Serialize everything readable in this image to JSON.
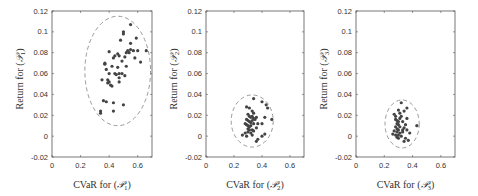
{
  "chart_data": [
    {
      "type": "scatter",
      "title": "",
      "xlabel": "CVaR for (P1)",
      "ylabel": "Return for (P1)",
      "xlabel_parts": {
        "pre": "CVaR for (",
        "sym": "𝒫",
        "sub": "1",
        "post": ")"
      },
      "ylabel_parts": {
        "pre": "Return for (",
        "sym": "𝒫",
        "sub": "1",
        "post": ")"
      },
      "xlim": [
        0,
        0.7
      ],
      "ylim": [
        -0.02,
        0.12
      ],
      "xticks": [
        0,
        0.2,
        0.4,
        0.6
      ],
      "xtick_labels": [
        "0",
        "0.2",
        "0.4",
        "0.6"
      ],
      "yticks": [
        -0.02,
        0,
        0.02,
        0.04,
        0.06,
        0.08,
        0.1,
        0.12
      ],
      "ytick_labels": [
        "-0.02",
        "0",
        "0.02",
        "0.04",
        "0.06",
        "0.08",
        "0.1",
        "0.12"
      ],
      "grid": false,
      "ellipse": {
        "cx": 0.46,
        "cy": 0.0625,
        "rx": 0.23,
        "ry": 0.0525,
        "style": "dashed"
      },
      "points": [
        [
          0.55,
          0.107
        ],
        [
          0.5,
          0.1
        ],
        [
          0.5,
          0.098
        ],
        [
          0.59,
          0.094
        ],
        [
          0.48,
          0.092
        ],
        [
          0.55,
          0.089
        ],
        [
          0.4,
          0.081
        ],
        [
          0.53,
          0.082
        ],
        [
          0.55,
          0.083
        ],
        [
          0.57,
          0.082
        ],
        [
          0.6,
          0.082
        ],
        [
          0.66,
          0.082
        ],
        [
          0.52,
          0.08
        ],
        [
          0.54,
          0.08
        ],
        [
          0.46,
          0.079
        ],
        [
          0.47,
          0.077
        ],
        [
          0.44,
          0.077
        ],
        [
          0.51,
          0.076
        ],
        [
          0.58,
          0.075
        ],
        [
          0.43,
          0.075
        ],
        [
          0.62,
          0.071
        ],
        [
          0.37,
          0.07
        ],
        [
          0.37,
          0.069
        ],
        [
          0.49,
          0.072
        ],
        [
          0.42,
          0.067
        ],
        [
          0.38,
          0.064
        ],
        [
          0.46,
          0.066
        ],
        [
          0.52,
          0.067
        ],
        [
          0.4,
          0.06
        ],
        [
          0.44,
          0.06
        ],
        [
          0.47,
          0.06
        ],
        [
          0.49,
          0.06
        ],
        [
          0.51,
          0.058
        ],
        [
          0.45,
          0.059
        ],
        [
          0.35,
          0.054
        ],
        [
          0.39,
          0.054
        ],
        [
          0.4,
          0.052
        ],
        [
          0.39,
          0.051
        ],
        [
          0.41,
          0.049
        ],
        [
          0.42,
          0.048
        ],
        [
          0.47,
          0.052
        ],
        [
          0.47,
          0.056
        ],
        [
          0.36,
          0.034
        ],
        [
          0.38,
          0.033
        ],
        [
          0.43,
          0.032
        ],
        [
          0.5,
          0.03
        ],
        [
          0.34,
          0.024
        ],
        [
          0.34,
          0.022
        ],
        [
          0.43,
          0.024
        ]
      ]
    },
    {
      "type": "scatter",
      "title": "",
      "xlabel": "CVaR for (P2)",
      "ylabel": "Return for (P2)",
      "xlabel_parts": {
        "pre": "CVaR for (",
        "sym": "𝒫",
        "sub": "2",
        "post": ")"
      },
      "ylabel_parts": {
        "pre": "Return for (",
        "sym": "𝒫",
        "sub": "2",
        "post": ")"
      },
      "xlim": [
        0,
        0.7
      ],
      "ylim": [
        -0.02,
        0.12
      ],
      "xticks": [
        0,
        0.2,
        0.4,
        0.6
      ],
      "xtick_labels": [
        "0",
        "0.2",
        "0.4",
        "0.6"
      ],
      "yticks": [
        -0.02,
        0,
        0.02,
        0.04,
        0.06,
        0.08,
        0.1,
        0.12
      ],
      "ytick_labels": [
        "-0.02",
        "0",
        "0.02",
        "0.04",
        "0.06",
        "0.08",
        "0.1",
        "0.12"
      ],
      "grid": false,
      "ellipse": {
        "cx": 0.33,
        "cy": 0.0145,
        "rx": 0.15,
        "ry": 0.025,
        "style": "dashed"
      },
      "points": [
        [
          0.34,
          0.036
        ],
        [
          0.4,
          0.033
        ],
        [
          0.43,
          0.03
        ],
        [
          0.44,
          0.027
        ],
        [
          0.29,
          0.028
        ],
        [
          0.31,
          0.027
        ],
        [
          0.33,
          0.024
        ],
        [
          0.34,
          0.022
        ],
        [
          0.3,
          0.021
        ],
        [
          0.31,
          0.019
        ],
        [
          0.32,
          0.018
        ],
        [
          0.33,
          0.019
        ],
        [
          0.34,
          0.017
        ],
        [
          0.29,
          0.016
        ],
        [
          0.3,
          0.015
        ],
        [
          0.31,
          0.014
        ],
        [
          0.32,
          0.013
        ],
        [
          0.33,
          0.015
        ],
        [
          0.35,
          0.016
        ],
        [
          0.36,
          0.018
        ],
        [
          0.42,
          0.018
        ],
        [
          0.47,
          0.016
        ],
        [
          0.28,
          0.012
        ],
        [
          0.29,
          0.011
        ],
        [
          0.3,
          0.01
        ],
        [
          0.31,
          0.009
        ],
        [
          0.32,
          0.01
        ],
        [
          0.34,
          0.012
        ],
        [
          0.37,
          0.012
        ],
        [
          0.3,
          0.007
        ],
        [
          0.31,
          0.006
        ],
        [
          0.33,
          0.006
        ],
        [
          0.36,
          0.008
        ],
        [
          0.4,
          0.012
        ],
        [
          0.28,
          0.003
        ],
        [
          0.3,
          0.004
        ],
        [
          0.32,
          0.003
        ],
        [
          0.26,
          0.001
        ],
        [
          0.29,
          0.0
        ],
        [
          0.33,
          0.001
        ],
        [
          0.42,
          0.002
        ],
        [
          0.4,
          0.0
        ],
        [
          0.37,
          -0.003
        ],
        [
          0.36,
          -0.005
        ],
        [
          0.34,
          0.005
        ]
      ]
    },
    {
      "type": "scatter",
      "title": "",
      "xlabel": "CVaR for (P3)",
      "ylabel": "Return for (P3)",
      "xlabel_parts": {
        "pre": "CVaR for (",
        "sym": "𝒫",
        "sub": "3",
        "post": ")"
      },
      "ylabel_parts": {
        "pre": "Return for (",
        "sym": "𝒫",
        "sub": "3",
        "post": ")"
      },
      "xlim": [
        0,
        0.7
      ],
      "ylim": [
        -0.02,
        0.12
      ],
      "xticks": [
        0,
        0.2,
        0.4,
        0.6
      ],
      "xtick_labels": [
        "0",
        "0.2",
        "0.4",
        "0.6"
      ],
      "yticks": [
        -0.02,
        0,
        0.02,
        0.04,
        0.06,
        0.08,
        0.1,
        0.12
      ],
      "ytick_labels": [
        "-0.02",
        "0",
        "0.02",
        "0.04",
        "0.06",
        "0.08",
        "0.1",
        "0.12"
      ],
      "grid": false,
      "ellipse": {
        "cx": 0.326,
        "cy": 0.0117,
        "rx": 0.121,
        "ry": 0.023,
        "style": "dashed"
      },
      "points": [
        [
          0.32,
          0.032
        ],
        [
          0.36,
          0.027
        ],
        [
          0.3,
          0.025
        ],
        [
          0.34,
          0.024
        ],
        [
          0.31,
          0.022
        ],
        [
          0.27,
          0.021
        ],
        [
          0.28,
          0.019
        ],
        [
          0.32,
          0.019
        ],
        [
          0.31,
          0.017
        ],
        [
          0.36,
          0.017
        ],
        [
          0.28,
          0.016
        ],
        [
          0.29,
          0.015
        ],
        [
          0.3,
          0.014
        ],
        [
          0.33,
          0.014
        ],
        [
          0.29,
          0.012
        ],
        [
          0.3,
          0.011
        ],
        [
          0.35,
          0.011
        ],
        [
          0.43,
          0.01
        ],
        [
          0.28,
          0.009
        ],
        [
          0.31,
          0.009
        ],
        [
          0.34,
          0.008
        ],
        [
          0.29,
          0.007
        ],
        [
          0.3,
          0.006
        ],
        [
          0.33,
          0.006
        ],
        [
          0.36,
          0.006
        ],
        [
          0.27,
          0.005
        ],
        [
          0.29,
          0.004
        ],
        [
          0.31,
          0.003
        ],
        [
          0.33,
          0.004
        ],
        [
          0.26,
          0.002
        ],
        [
          0.28,
          0.001
        ],
        [
          0.3,
          0.001
        ],
        [
          0.32,
          0.0
        ],
        [
          0.38,
          0.003
        ],
        [
          0.29,
          -0.001
        ],
        [
          0.35,
          -0.002
        ],
        [
          0.37,
          -0.004
        ],
        [
          0.34,
          -0.005
        ],
        [
          0.3,
          -0.002
        ]
      ]
    }
  ],
  "layout": {
    "axes": [
      {
        "x0": 52,
        "x1": 152,
        "y0": 11,
        "y1": 157
      },
      {
        "x0": 206,
        "x1": 304,
        "y0": 11,
        "y1": 157
      },
      {
        "x0": 356,
        "x1": 455,
        "y0": 11,
        "y1": 157
      }
    ],
    "colors": {
      "points": "#444444",
      "ellipse": "#999999",
      "frame": "#555555",
      "text": "#333333"
    }
  }
}
